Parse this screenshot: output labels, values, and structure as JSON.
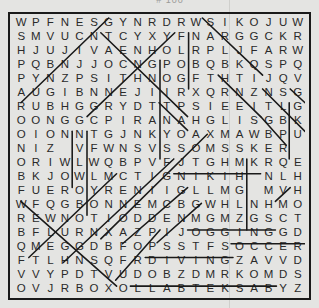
{
  "puzzle": {
    "rows": [
      "WPFNESGYNRDRWSIKOJUW",
      "SMVUCNTCYXYFNARGGCKR",
      "HJUJIVAENHOLRPLJFARW",
      "PQBNJJOCNGPOBQBKQSPQ",
      "PYNZPSITHNOGFTHTIJQV",
      "AUGIBNNEJIIRXQRNZNSG",
      "RUBHGGRYDTTPSIEEITLGN",
      "OONGGCPIRANAHGLISGBK",
      "OIONNTGJNKYOAXMAWBPU",
      "NIZ VFWNSVSSOMSSKER",
      "ORIWLWQBPVFJTGHMKRQE",
      "BKJOWLMCTIGNIKIH NLH",
      "FUEROYRENIIGLLMG MVH",
      "WFQGBONNEMCBGWHLNHMO",
      "REWNOTIODDENMGMZGSCT",
      "BFLURNXAZPIJOGGINGGD",
      "QMEGGDBFOPSSTFSOCCER",
      "FTLHNSQFRDIVINGZAVVD",
      "VVYPDTVUDOBZDMRKOMDS",
      "OVJRBOXOLLABTEKSABYZ"
    ],
    "columns": 20,
    "row_count": 20,
    "found_words_struck": [
      "JOGGING",
      "SOCCER",
      "DIVING",
      "BASKETBALL",
      "HIKING"
    ],
    "header_remnant": "# 100"
  }
}
